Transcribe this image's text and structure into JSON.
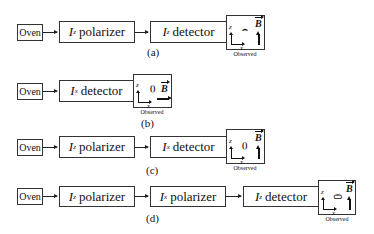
{
  "oven_label": "Oven",
  "observed_label": "Observed",
  "field_symbol": "B",
  "axis_z": "z",
  "axis_x": "x",
  "rows": [
    {
      "caption": "(a)",
      "stages": [
        {
          "op": "I",
          "sub": "z",
          "kind": "polarizer"
        },
        {
          "op": "I",
          "sub": "z",
          "kind": "detector"
        }
      ],
      "pattern": "⌢",
      "field_direction": "up"
    },
    {
      "caption": "(b)",
      "stages": [
        {
          "op": "I",
          "sub": "x",
          "kind": "detector"
        }
      ],
      "pattern": "()",
      "field_direction": "right"
    },
    {
      "caption": "(c)",
      "stages": [
        {
          "op": "I",
          "sub": "z",
          "kind": "polarizer"
        },
        {
          "op": "I",
          "sub": "x",
          "kind": "detector"
        }
      ],
      "pattern": "()",
      "field_direction": "up"
    },
    {
      "caption": "(d)",
      "stages": [
        {
          "op": "I",
          "sub": "z",
          "kind": "polarizer"
        },
        {
          "op": "I",
          "sub": "x",
          "kind": "polarizer"
        },
        {
          "op": "I",
          "sub": "z",
          "kind": "detector"
        }
      ],
      "pattern": "⊂⊃",
      "field_direction": "up"
    }
  ]
}
